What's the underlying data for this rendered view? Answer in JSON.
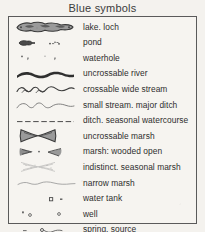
{
  "legend": {
    "title": "Blue symbols",
    "ink_color": "#2e2e2e",
    "border_color": "#5a5a5a",
    "paper_color": "#f4f2ee",
    "fill_grey": "#8a8a8a",
    "rows": [
      {
        "icon": "lake-blob-symbol",
        "label": "lake.  loch"
      },
      {
        "icon": "pond-symbol",
        "label": "pond"
      },
      {
        "icon": "waterhole-symbol",
        "label": "waterhole"
      },
      {
        "icon": "uncrossable-river-symbol",
        "label": "uncrossable river"
      },
      {
        "icon": "crossable-wide-stream-symbol",
        "label": "crossable wide stream"
      },
      {
        "icon": "small-stream-symbol",
        "label": "small  stream.  major ditch"
      },
      {
        "icon": "ditch-dashed-line-symbol",
        "label": "ditch.   seasonal watercourse"
      },
      {
        "icon": "uncrossable-marsh-symbol",
        "label": "uncrossable marsh"
      },
      {
        "icon": "marsh-wooded-open-symbol",
        "label": "marsh:  wooded    open"
      },
      {
        "icon": "indistinct-marsh-symbol",
        "label": "indistinct.  seasonal marsh"
      },
      {
        "icon": "narrow-marsh-symbol",
        "label": "narrow marsh"
      },
      {
        "icon": "water-tank-symbol",
        "label": "water tank"
      },
      {
        "icon": "well-symbol",
        "label": "well"
      },
      {
        "icon": "spring-source-symbol",
        "label": "spring.  source"
      }
    ]
  }
}
